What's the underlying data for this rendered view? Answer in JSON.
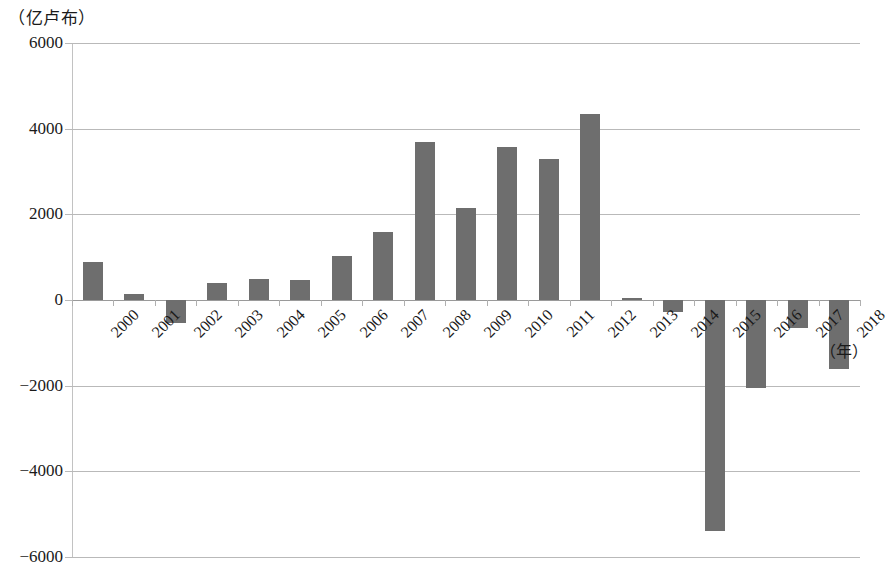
{
  "chart_data": {
    "type": "bar",
    "title": "",
    "subtitle": "",
    "unit_label": "（亿卢布）",
    "xlabel": "（年）",
    "ylabel": "",
    "categories": [
      "2000",
      "2001",
      "2002",
      "2003",
      "2004",
      "2005",
      "2006",
      "2007",
      "2008",
      "2009",
      "2010",
      "2011",
      "2012",
      "2013",
      "2014",
      "2015",
      "2016",
      "2017",
      "2018"
    ],
    "values": [
      880,
      140,
      -530,
      390,
      480,
      470,
      1030,
      1580,
      3690,
      2140,
      3570,
      3300,
      4350,
      40,
      -280,
      -5400,
      -2050,
      -660,
      -1620
    ],
    "ylim": [
      -6000,
      6000
    ],
    "ytick_labels": [
      "6000",
      "4000",
      "2000",
      "0",
      "-2000",
      "-4000",
      "-6000"
    ],
    "ytick_values": [
      6000,
      4000,
      2000,
      0,
      -2000,
      -4000,
      -6000
    ],
    "grid": true,
    "legend": "none",
    "bar_color": "#6e6e6e"
  }
}
